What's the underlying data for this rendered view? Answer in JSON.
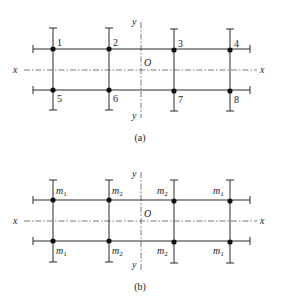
{
  "figure": {
    "panels": [
      {
        "id": "a",
        "caption": "(a)",
        "axes": {
          "x_label": "x",
          "y_label": "y",
          "origin_label": "O"
        },
        "rows": {
          "top_y": 49,
          "bottom_y": 90,
          "axis_y": 70
        },
        "columns_x": [
          53,
          109,
          174,
          230
        ],
        "y_axis_x": 141,
        "top_labels": [
          "1",
          "2",
          "3",
          "4"
        ],
        "bottom_labels": [
          "5",
          "6",
          "7",
          "8"
        ]
      },
      {
        "id": "b",
        "caption": "(b)",
        "axes": {
          "x_label": "x",
          "y_label": "y",
          "origin_label": "O"
        },
        "rows": {
          "top_y": 200,
          "bottom_y": 241,
          "axis_y": 221
        },
        "columns_x": [
          53,
          109,
          174,
          230
        ],
        "y_axis_x": 141,
        "top_labels": [
          {
            "base": "m",
            "sub": "1"
          },
          {
            "base": "m",
            "sub": "2"
          },
          {
            "base": "m",
            "sub": "2"
          },
          {
            "base": "m",
            "sub": "1"
          }
        ],
        "bottom_labels": [
          {
            "base": "m",
            "sub": "1"
          },
          {
            "base": "m",
            "sub": "2"
          },
          {
            "base": "m",
            "sub": "2"
          },
          {
            "base": "m",
            "sub": "1"
          }
        ]
      }
    ],
    "colors": {
      "line": "#2a2a2a",
      "axis": "#555555",
      "node": "#111111"
    }
  }
}
